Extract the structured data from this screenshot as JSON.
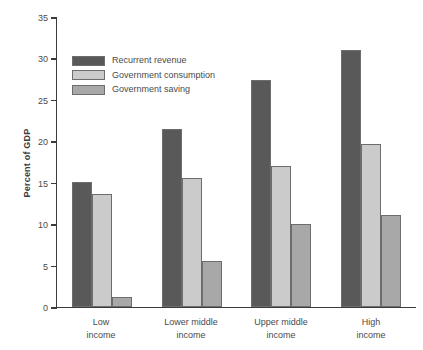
{
  "chart_data": {
    "type": "bar",
    "title": "",
    "xlabel": "",
    "ylabel": "Percent of GDP",
    "ylim": [
      0,
      35
    ],
    "ytick_step": 5,
    "yticks": [
      35,
      30,
      25,
      20,
      15,
      10,
      5,
      0
    ],
    "grid": false,
    "legend_position": "upper-left-inside",
    "categories": [
      "Low income",
      "Lower middle income",
      "Upper middle income",
      "High income"
    ],
    "category_lines": [
      [
        "Low",
        "income"
      ],
      [
        "Lower middle",
        "income"
      ],
      [
        "Upper middle",
        "income"
      ],
      [
        "High",
        "income"
      ]
    ],
    "series": [
      {
        "name": "Recurrent revenue",
        "color": "#595959",
        "values": [
          15.1,
          21.5,
          27.4,
          31.0
        ]
      },
      {
        "name": "Government consumption",
        "color": "#cbcbcb",
        "values": [
          13.7,
          15.6,
          17.0,
          19.7
        ]
      },
      {
        "name": "Government saving",
        "color": "#a8a8a8",
        "values": [
          1.2,
          5.6,
          10.0,
          11.1
        ]
      }
    ]
  },
  "colors": {
    "axis": "#3b3b3b",
    "text": "#4a4a4a",
    "bar_outline": "#6d6d6d",
    "background": "#ffffff"
  }
}
